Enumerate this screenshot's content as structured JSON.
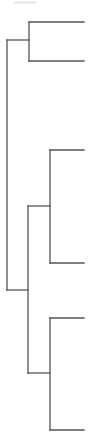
{
  "diagram": {
    "type": "dendrogram",
    "orientation": "left-to-right",
    "line_color": "#555555",
    "background": "#ffffff",
    "leaf_count": 6,
    "nodes": [
      {
        "id": "root",
        "x": 7,
        "y_top": 40,
        "y_bottom": 290,
        "children": [
          "n1",
          "n2"
        ]
      },
      {
        "id": "n1",
        "x": 29,
        "y_top": 22,
        "y_bottom": 61,
        "join_y": 40,
        "children": [
          "leaf1",
          "leaf2"
        ]
      },
      {
        "id": "n2",
        "x": 28,
        "y_top": 206,
        "y_bottom": 373,
        "join_y": 290,
        "children": [
          "n3",
          "n4"
        ]
      },
      {
        "id": "n3",
        "x": 50,
        "y_top": 150,
        "y_bottom": 263,
        "join_y": 206,
        "children": [
          "leaf3",
          "leaf4"
        ]
      },
      {
        "id": "n4",
        "x": 50,
        "y_top": 318,
        "y_bottom": 430,
        "join_y": 373,
        "children": [
          "leaf5",
          "leaf6"
        ]
      }
    ],
    "leaves": [
      {
        "id": "leaf1",
        "y": 22,
        "x_start": 29,
        "x_end": 84
      },
      {
        "id": "leaf2",
        "y": 61,
        "x_start": 29,
        "x_end": 84
      },
      {
        "id": "leaf3",
        "y": 150,
        "x_start": 50,
        "x_end": 84
      },
      {
        "id": "leaf4",
        "y": 263,
        "x_start": 50,
        "x_end": 84
      },
      {
        "id": "leaf5",
        "y": 318,
        "x_start": 50,
        "x_end": 84
      },
      {
        "id": "leaf6",
        "y": 430,
        "x_start": 50,
        "x_end": 84
      }
    ]
  }
}
